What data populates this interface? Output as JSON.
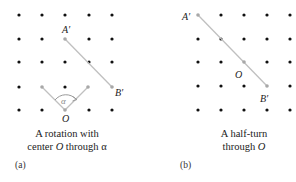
{
  "colors": {
    "dot": "#111111",
    "highlight_dot": "#a8a8a8",
    "segment": "#c0c0c0",
    "text": "#222222"
  },
  "panel_a": {
    "label": "(a)",
    "caption_line1": "A rotation with",
    "caption_line2_prefix": "center ",
    "caption_line2_var": "O",
    "caption_line2_suffix": " through α",
    "points": {
      "A_prime": "A′",
      "B_prime": "B′",
      "O": "O",
      "alpha": "α"
    },
    "grid": {
      "cols": 5,
      "rows": 5,
      "x0": 19,
      "y0": 15,
      "dx": 23.3,
      "dy": 23.7
    }
  },
  "panel_b": {
    "label": "(b)",
    "caption_line1": "A half-turn",
    "caption_line2_prefix": "through ",
    "caption_line2_var": "O",
    "points": {
      "A_prime": "A′",
      "B_prime": "B′",
      "O": "O"
    },
    "grid": {
      "cols": 5,
      "rows": 5,
      "x0": 198,
      "y0": 15,
      "dx": 23,
      "dy": 23.7
    }
  }
}
